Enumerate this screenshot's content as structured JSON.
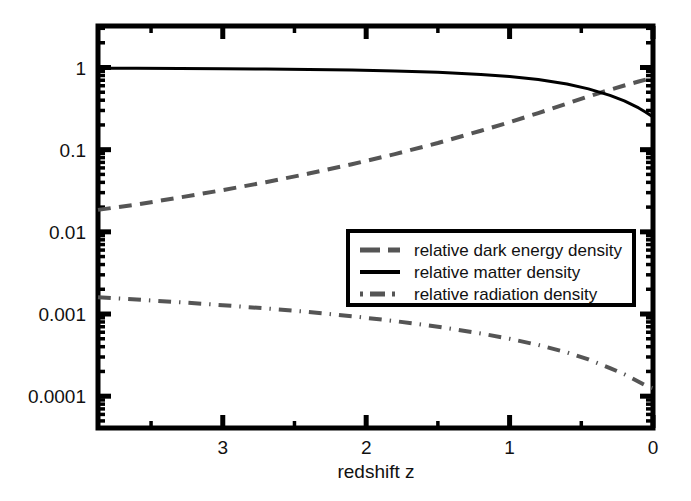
{
  "figure": {
    "background_color": "#ffffff",
    "frame_color": "#000000",
    "frame": {
      "left": 98,
      "top": 26,
      "right": 653,
      "bottom": 428
    }
  },
  "chart_data": {
    "type": "line",
    "title": "",
    "subtitle": "",
    "xlabel": "redshift z",
    "ylabel": "",
    "xscale": "linear",
    "yscale": "log",
    "x_reversed": true,
    "xlim": [
      3.87,
      0.0
    ],
    "ylim": [
      4.1e-05,
      3.2
    ],
    "grid": false,
    "xticks": [
      3,
      2,
      1,
      0
    ],
    "xtick_labels": [
      "3",
      "2",
      "1",
      "0"
    ],
    "yticks": [
      1,
      0.1,
      0.01,
      0.001,
      0.0001
    ],
    "ytick_labels": [
      "1",
      "0.1",
      "0.01",
      "0.001",
      "0.0001"
    ],
    "legend_position": "center-right",
    "series": [
      {
        "name": "relative dark energy density",
        "style": "dashed",
        "color": "#555555",
        "width": 4,
        "x": [
          3.87,
          3.6,
          3.3,
          3.0,
          2.7,
          2.4,
          2.1,
          1.8,
          1.5,
          1.2,
          1.0,
          0.8,
          0.6,
          0.45,
          0.3,
          0.2,
          0.1,
          0.05,
          0.0
        ],
        "y": [
          0.0185,
          0.0215,
          0.0262,
          0.0322,
          0.0402,
          0.0512,
          0.0664,
          0.0883,
          0.1205,
          0.17,
          0.216,
          0.279,
          0.364,
          0.445,
          0.537,
          0.604,
          0.675,
          0.712,
          0.75
        ]
      },
      {
        "name": "relative matter density",
        "style": "solid",
        "color": "#000000",
        "width": 3,
        "x": [
          3.87,
          3.6,
          3.3,
          3.0,
          2.7,
          2.4,
          2.1,
          1.8,
          1.5,
          1.2,
          1.0,
          0.8,
          0.6,
          0.45,
          0.3,
          0.2,
          0.1,
          0.05,
          0.0
        ],
        "y": [
          0.98,
          0.977,
          0.9725,
          0.9665,
          0.958,
          0.947,
          0.931,
          0.908,
          0.874,
          0.823,
          0.776,
          0.713,
          0.629,
          0.549,
          0.458,
          0.392,
          0.322,
          0.286,
          0.25
        ]
      },
      {
        "name": "relative radiation density",
        "style": "dashdot",
        "color": "#555555",
        "width": 4,
        "x": [
          3.87,
          3.6,
          3.3,
          3.0,
          2.7,
          2.4,
          2.1,
          1.8,
          1.5,
          1.2,
          1.0,
          0.8,
          0.6,
          0.45,
          0.3,
          0.2,
          0.1,
          0.05,
          0.0
        ],
        "y": [
          0.0016,
          0.0015,
          0.00139,
          0.00128,
          0.00117,
          0.00106,
          0.00094,
          0.00082,
          0.0007,
          0.00058,
          0.0005,
          0.00042,
          0.00034,
          0.00028,
          0.00022,
          0.000185,
          0.00015,
          0.000135,
          0.000125
        ]
      }
    ]
  },
  "legend": {
    "box": {
      "x": 348,
      "y": 231,
      "width": 286,
      "height": 74
    },
    "border_color": "#000000",
    "background": "#ffffff",
    "entries": [
      {
        "label": "relative dark energy density",
        "style": "dashed",
        "color": "#555555"
      },
      {
        "label": "relative matter density",
        "style": "solid",
        "color": "#000000"
      },
      {
        "label": "relative radiation density",
        "style": "dashdot",
        "color": "#555555"
      }
    ]
  }
}
